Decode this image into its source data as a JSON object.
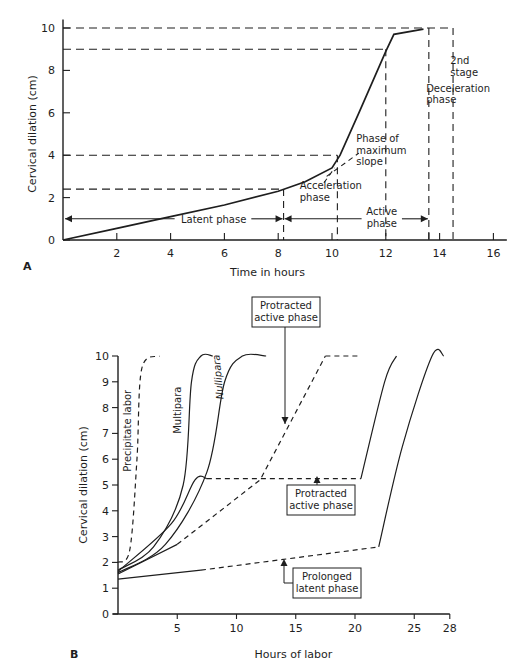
{
  "figure": {
    "panel_a_label": "A",
    "panel_b_label": "B"
  },
  "chart_data": [
    {
      "type": "line",
      "panel": "A",
      "title": "",
      "xlabel": "Time in hours",
      "ylabel": "Cervical dilation (cm)",
      "xlim": [
        0,
        16.5
      ],
      "ylim": [
        0,
        10
      ],
      "x_ticks": [
        2,
        4,
        6,
        8,
        10,
        12,
        14,
        16
      ],
      "y_ticks": [
        0,
        2,
        4,
        6,
        8,
        10
      ],
      "grid": false,
      "series": [
        {
          "name": "Labor curve",
          "style": "solid",
          "points": [
            [
              0,
              0
            ],
            [
              2,
              0.55
            ],
            [
              4,
              1.1
            ],
            [
              6,
              1.65
            ],
            [
              8,
              2.3
            ],
            [
              9,
              2.75
            ],
            [
              10,
              3.4
            ],
            [
              10.3,
              4.0
            ],
            [
              11,
              6.0
            ],
            [
              12,
              8.9
            ],
            [
              12.3,
              9.7
            ],
            [
              13.4,
              9.95
            ]
          ]
        },
        {
          "name": "Maximum slope tangent",
          "style": "dashed",
          "points": [
            [
              9.8,
              3.0
            ],
            [
              11.0,
              4.1
            ]
          ]
        },
        {
          "name": "Acceleration tangent",
          "style": "dashed",
          "points": [
            [
              9.7,
              2.7
            ],
            [
              10.1,
              3.4
            ]
          ]
        }
      ],
      "reference_lines": {
        "horizontal_dashed": [
          10,
          9,
          4,
          2.4
        ],
        "vertical_dashed": [
          8.2,
          10.2,
          12,
          13.6,
          14.5
        ]
      },
      "annotations": [
        {
          "text": "Latent phase",
          "x": 4.8,
          "y": 1.0
        },
        {
          "text": "Acceleration phase",
          "x": 9.9,
          "y": 2.0
        },
        {
          "text": "Phase of maximum slope",
          "x": 11.0,
          "y": 4.2
        },
        {
          "text": "Active phase",
          "x": 11.8,
          "y": 0.9
        },
        {
          "text": "Deceleration phase",
          "x": 14.0,
          "y": 7.0
        },
        {
          "text": "2nd stage",
          "x": 14.6,
          "y": 8.5
        }
      ],
      "phase_arrows": [
        {
          "label": "Latent phase",
          "from": 0,
          "to": 8.2
        },
        {
          "label": "Active phase",
          "from": 8.2,
          "to": 13.6
        }
      ]
    },
    {
      "type": "line",
      "panel": "B",
      "title": "",
      "xlabel": "Hours of labor",
      "ylabel": "Cervical dilation (cm)",
      "xlim": [
        0,
        28
      ],
      "ylim": [
        0,
        10
      ],
      "x_ticks": [
        5,
        10,
        15,
        20,
        25,
        28
      ],
      "y_ticks": [
        0,
        1,
        2,
        3,
        4,
        5,
        6,
        7,
        8,
        9,
        10
      ],
      "grid": false,
      "series": [
        {
          "name": "Precipitate labor",
          "style": "dashed",
          "points": [
            [
              0,
              2.0
            ],
            [
              1.0,
              2.5
            ],
            [
              1.6,
              6.0
            ],
            [
              2.0,
              9.5
            ],
            [
              3.5,
              10.0
            ]
          ]
        },
        {
          "name": "Multipara",
          "style": "solid",
          "points": [
            [
              0,
              1.7
            ],
            [
              3.0,
              2.6
            ],
            [
              5.5,
              5.0
            ],
            [
              6.2,
              9.0
            ],
            [
              7.0,
              10.0
            ],
            [
              8.0,
              10.0
            ]
          ]
        },
        {
          "name": "Nullipara",
          "style": "solid",
          "points": [
            [
              0,
              1.6
            ],
            [
              4.0,
              2.7
            ],
            [
              7.5,
              5.5
            ],
            [
              9.0,
              9.0
            ],
            [
              10.5,
              10.0
            ],
            [
              12.5,
              10.0
            ]
          ]
        },
        {
          "name": "Secondary arrest",
          "style": "solid+dashed",
          "points": [
            [
              0,
              1.65
            ],
            [
              4.5,
              3.5
            ],
            [
              6.5,
              5.2
            ],
            [
              7.5,
              5.25
            ],
            [
              20.5,
              5.25
            ],
            [
              22.5,
              9.0
            ],
            [
              23.5,
              10.0
            ]
          ]
        },
        {
          "name": "Protracted active phase",
          "style": "solid+dashed",
          "points": [
            [
              0,
              1.55
            ],
            [
              5.0,
              2.7
            ],
            [
              12.0,
              5.2
            ],
            [
              17.5,
              10.0
            ],
            [
              20.5,
              10.0
            ]
          ]
        },
        {
          "name": "Prolonged latent phase",
          "style": "solid+dashed",
          "points": [
            [
              0,
              1.35
            ],
            [
              7.0,
              1.7
            ],
            [
              22.0,
              2.6
            ],
            [
              24.0,
              6.5
            ],
            [
              26.5,
              10.0
            ],
            [
              27.5,
              10.0
            ]
          ]
        }
      ],
      "annotations": [
        {
          "text": "Precipitate labor",
          "x": 1.3,
          "y": 7.0,
          "rotated": true
        },
        {
          "text": "Multipara",
          "x": 5.0,
          "y": 8.0,
          "rotated": true
        },
        {
          "text": "Nullipara",
          "x": 8.5,
          "y": 9.0,
          "rotated": true
        },
        {
          "text": "Protracted active phase",
          "x": 14.6,
          "y": 12.0,
          "boxed": true,
          "arrow_to": [
            14.3,
            7.6
          ]
        },
        {
          "text": "Protracted active phase",
          "x": 17.4,
          "y": 4.0,
          "boxed": true,
          "arrow_to": [
            17.2,
            5.3
          ]
        },
        {
          "text": "Prolonged latent phase",
          "x": 17.5,
          "y": 1.0,
          "boxed": true,
          "arrow_to": [
            14.2,
            2.1
          ]
        }
      ]
    }
  ]
}
